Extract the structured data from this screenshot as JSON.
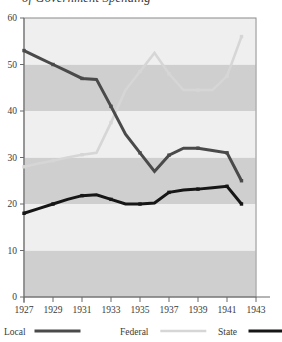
{
  "figure": {
    "title_partial": "of Government Spending",
    "background": "#ffffff"
  },
  "chart_data": {
    "type": "line",
    "title": "of Government Spending",
    "xlabel": "",
    "ylabel": "",
    "xlim": [
      1927,
      1943
    ],
    "ylim": [
      0,
      60
    ],
    "grid": false,
    "banded_background": true,
    "band_colors": [
      "#efefef",
      "#cfcfcf"
    ],
    "legend_position": "bottom",
    "x_ticks": [
      1927,
      1929,
      1931,
      1933,
      1935,
      1937,
      1939,
      1941,
      1943
    ],
    "y_ticks": [
      0,
      10,
      20,
      30,
      40,
      50,
      60
    ],
    "x": [
      1927,
      1928,
      1929,
      1930,
      1931,
      1932,
      1933,
      1934,
      1935,
      1936,
      1937,
      1938,
      1939,
      1940,
      1941,
      1942
    ],
    "series": [
      {
        "name": "Local",
        "color": "#4a4a4a",
        "values": [
          53.0,
          51.5,
          50.0,
          48.5,
          47.0,
          46.8,
          41.0,
          35.0,
          31.0,
          27.0,
          30.5,
          32.0,
          32.0,
          31.5,
          31.0,
          25.0
        ]
      },
      {
        "name": "Federal",
        "color": "#d6d6d6",
        "values": [
          28.0,
          28.7,
          29.3,
          30.0,
          30.6,
          31.0,
          37.5,
          44.5,
          48.5,
          52.5,
          48.0,
          44.5,
          44.5,
          44.5,
          47.5,
          56.0
        ]
      },
      {
        "name": "State",
        "color": "#161616",
        "values": [
          18.0,
          19.0,
          20.0,
          21.0,
          21.8,
          22.0,
          21.0,
          20.0,
          20.0,
          20.2,
          22.5,
          23.0,
          23.2,
          23.5,
          23.8,
          20.0
        ]
      }
    ]
  },
  "axis": {
    "y_tick_labels": [
      "60",
      "50",
      "40",
      "30",
      "20",
      "10",
      "0"
    ],
    "x_tick_labels": [
      "1927",
      "1929",
      "1931",
      "1933",
      "1935",
      "1937",
      "1939",
      "1941",
      "1943"
    ]
  },
  "legend": {
    "items": [
      {
        "label": "Local",
        "color": "#4a4a4a",
        "thickness": 3.2
      },
      {
        "label": "Federal",
        "color": "#d6d6d6",
        "thickness": 2.6
      },
      {
        "label": "State",
        "color": "#161616",
        "thickness": 3.2
      }
    ]
  }
}
